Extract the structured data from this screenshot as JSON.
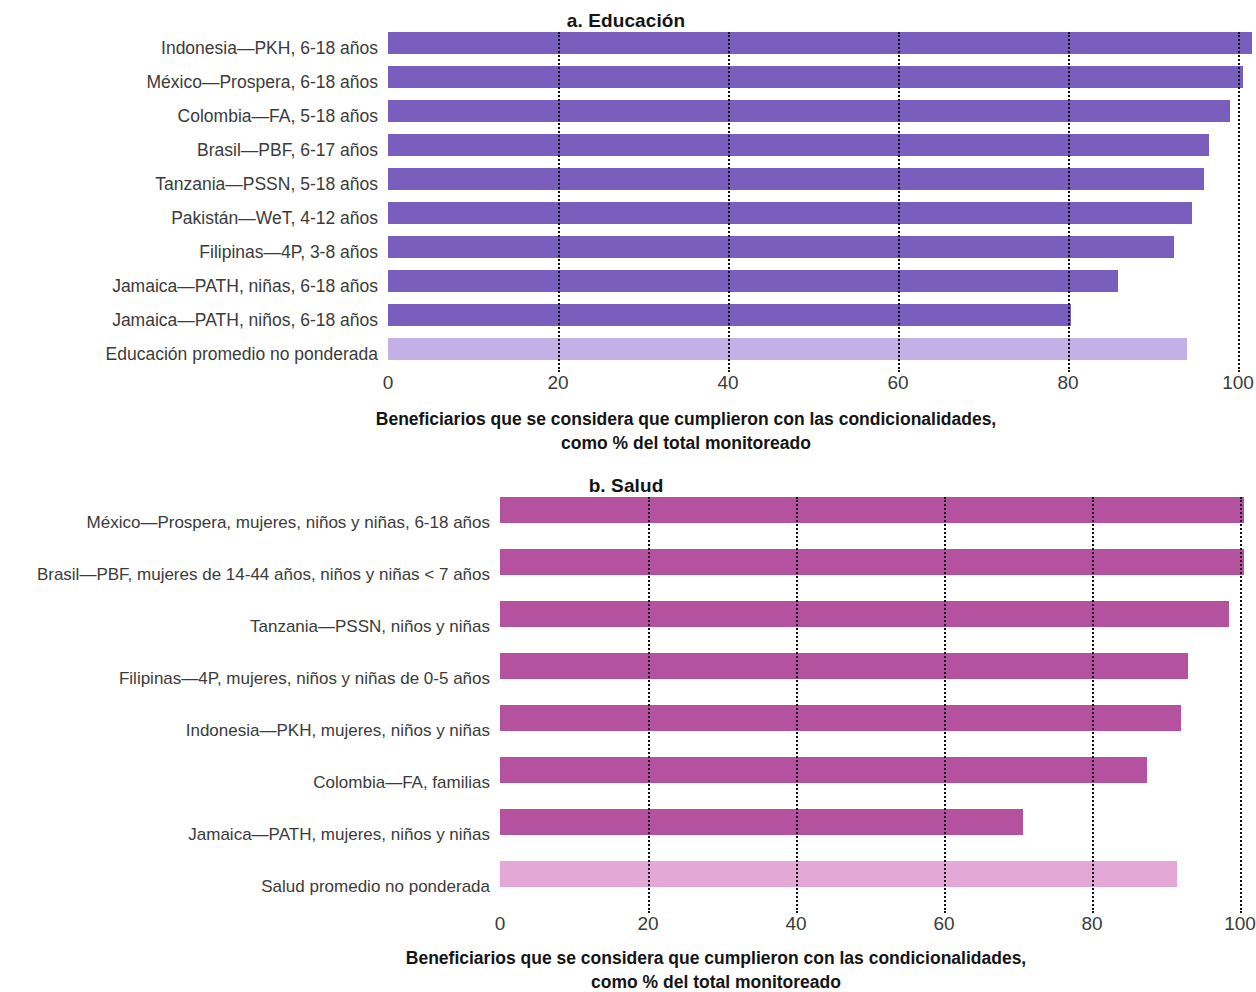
{
  "figure": {
    "panels": [
      "a. Educación",
      "b. Salud"
    ]
  },
  "chart_data": [
    {
      "type": "bar",
      "orientation": "horizontal",
      "title": "a. Educación",
      "xlabel": "Beneficiarios que se considera que cumplieron con las condicionalidades, como % del total monitoreado",
      "xlabel_line1": "Beneficiarios que se considera que cumplieron con las condicionalidades,",
      "xlabel_line2": "como % del total monitoreado",
      "ylabel": "",
      "xlim": [
        0,
        100
      ],
      "xticks": [
        0,
        20,
        40,
        60,
        80,
        100
      ],
      "xtick_labels": [
        "0",
        "20",
        "40",
        "60",
        "80",
        "100"
      ],
      "grid": "dotted-vertical",
      "legend": "none",
      "bar_color": "#7a5ebe",
      "average_bar_color": "#c3b0e6",
      "categories": [
        "Indonesia—PKH, 6-18 años",
        "México—Prospera, 6-18 años",
        "Colombia—FA, 5-18 años",
        "Brasil—PBF, 6-17 años",
        "Tanzania—PSSN, 5-18 años",
        "Pakistán—WeT, 4-12 años",
        "Filipinas—4P, 3-8 años",
        "Jamaica—PATH, niñas, 6-18 años",
        "Jamaica—PATH, niños, 6-18 años",
        "Educación promedio no ponderada"
      ],
      "values": [
        100,
        99,
        97.5,
        95,
        94.5,
        93,
        91,
        84.5,
        79,
        92.5
      ],
      "average_index": 9
    },
    {
      "type": "bar",
      "orientation": "horizontal",
      "title": "b. Salud",
      "xlabel": "Beneficiarios que se considera que cumplieron con las condicionalidades, como % del total monitoreado",
      "xlabel_line1": "Beneficiarios que se considera que cumplieron con las condicionalidades,",
      "xlabel_line2": "como % del total monitoreado",
      "ylabel": "",
      "xlim": [
        0,
        100
      ],
      "xticks": [
        0,
        20,
        40,
        60,
        80,
        100
      ],
      "xtick_labels": [
        "0",
        "20",
        "40",
        "60",
        "80",
        "100"
      ],
      "grid": "dotted-vertical",
      "legend": "none",
      "bar_color": "#b4529f",
      "average_bar_color": "#e4a8d6",
      "categories": [
        "México—Prospera, mujeres, niños y niñas, 6-18 años",
        "Brasil—PBF, mujeres de 14-44 años, niños y niñas < 7 años",
        "Tanzania—PSSN, niños y niñas",
        "Filipinas—4P, mujeres, niños y niñas de 0-5 años",
        "Indonesia—PKH, mujeres, niños y niñas",
        "Colombia—FA, familias",
        "Jamaica—PATH, mujeres, niños y niñas",
        "Salud promedio no ponderada"
      ],
      "values": [
        99,
        99,
        97,
        91.5,
        90.5,
        86,
        69.5,
        90
      ],
      "average_index": 7
    }
  ]
}
